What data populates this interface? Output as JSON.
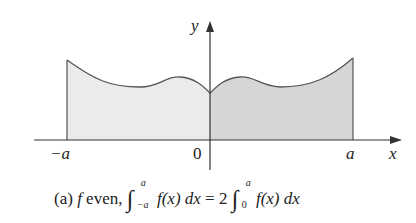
{
  "figure": {
    "axes": {
      "x_label": "x",
      "y_label": "y",
      "origin_label": "0",
      "left_label": "−a",
      "right_label": "a"
    },
    "curve": {
      "description": "even function f symmetric about y-axis, shaded from -a to a",
      "left_fill": "#ebebeb",
      "right_fill": "#d6d6d6",
      "stroke": "#555555"
    },
    "caption": {
      "prefix": "(a)",
      "f": "f",
      "even": "even,",
      "int1_upper": "a",
      "int1_lower": "−a",
      "integrand1": "f(x) dx",
      "equals": "= 2",
      "int2_upper": "a",
      "int2_lower": "0",
      "integrand2": "f(x) dx"
    }
  }
}
